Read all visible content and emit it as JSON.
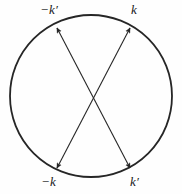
{
  "figure": {
    "type": "circle-with-crossed-scattering-vectors",
    "background_color": "#fefefe",
    "stroke_color": "#262626",
    "circle": {
      "center_x": 91,
      "center_y": 96,
      "radius_x": 81,
      "radius_y": 81,
      "stroke_width": 1.8
    },
    "vectors": [
      {
        "name": "vector-minus-k-prime-to-k-prime",
        "from_x": 130,
        "from_y": 168,
        "to_x": 57,
        "to_y": 28,
        "double_headed": true,
        "stroke_width": 1.1
      },
      {
        "name": "vector-minus-k-to-k",
        "from_x": 57,
        "from_y": 168,
        "to_x": 130,
        "to_y": 28,
        "double_headed": true,
        "stroke_width": 1.1
      }
    ],
    "labels": {
      "top_left": "−k′",
      "top_right": "k",
      "bottom_left": "−k",
      "bottom_right": "k′"
    }
  }
}
